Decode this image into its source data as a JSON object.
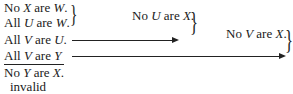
{
  "premises": [
    {
      "pre": "No ",
      "a": "X",
      "mid": " are ",
      "b": "W",
      "post": "."
    },
    {
      "pre": "All ",
      "a": "U",
      "mid": " are ",
      "b": "W",
      "post": "."
    },
    {
      "pre": "All ",
      "a": "V",
      "mid": " are ",
      "b": "U",
      "post": "."
    },
    {
      "pre": "All ",
      "a": "V",
      "mid": " are ",
      "b": "Y",
      "post": ""
    }
  ],
  "conclusion": {
    "pre": "No ",
    "a": "Y",
    "mid": " are ",
    "b": "X",
    "post": "."
  },
  "verdict": "invalid",
  "intermediate_1": {
    "pre": "No ",
    "a": "U",
    "mid": " are ",
    "b": "X",
    "post": "."
  },
  "intermediate_2": {
    "pre": "No ",
    "a": "V",
    "mid": " are ",
    "b": "X",
    "post": "."
  }
}
